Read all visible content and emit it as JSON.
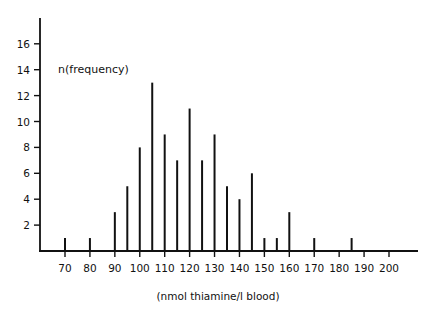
{
  "chart_data": {
    "type": "bar",
    "title": "",
    "annotation": "n(frequency)",
    "xlabel": "(nmol thiamine/l blood)",
    "ylabel": "n(frequency)",
    "x": [
      70,
      80,
      90,
      95,
      100,
      105,
      110,
      115,
      120,
      125,
      130,
      135,
      140,
      145,
      150,
      155,
      160,
      170,
      185
    ],
    "values": [
      1,
      1,
      3,
      5,
      8,
      13,
      9,
      7,
      11,
      7,
      9,
      5,
      4,
      6,
      1,
      1,
      3,
      1,
      1
    ],
    "xticks": [
      70,
      80,
      90,
      100,
      110,
      120,
      130,
      140,
      150,
      160,
      170,
      180,
      190,
      200
    ],
    "yticks": [
      2,
      4,
      6,
      8,
      10,
      12,
      14,
      16
    ],
    "xlim": [
      60,
      210
    ],
    "ylim": [
      0,
      18
    ],
    "grid": false,
    "legend": null,
    "bar_style": "thin vertical lines"
  }
}
